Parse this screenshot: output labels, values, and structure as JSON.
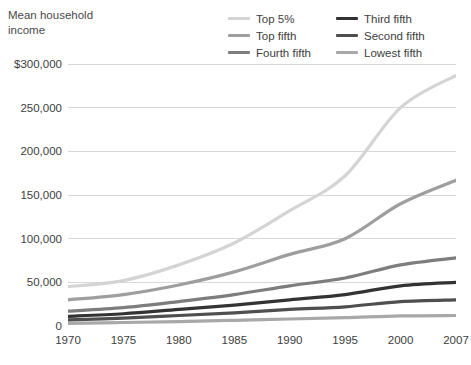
{
  "axis_title": "Mean household\nincome",
  "legend": {
    "entries": [
      {
        "label": "Top 5%",
        "color": "#d4d4d4",
        "column": 0
      },
      {
        "label": "Third fifth",
        "color": "#333333",
        "column": 1
      },
      {
        "label": "Top fifth",
        "color": "#9e9e9e",
        "column": 0
      },
      {
        "label": "Second fifth",
        "color": "#4f4f4f",
        "column": 1
      },
      {
        "label": "Fourth fifth",
        "color": "#7d7d7d",
        "column": 0
      },
      {
        "label": "Lowest fifth",
        "color": "#a8a8a8",
        "column": 1
      }
    ]
  },
  "chart_data": {
    "type": "line",
    "title": "",
    "xlabel": "",
    "ylabel": "Mean household income",
    "x": [
      1970,
      1975,
      1980,
      1985,
      1990,
      1995,
      2000,
      2007
    ],
    "xtick_labels": [
      "1970",
      "1975",
      "1980",
      "1985",
      "1990",
      "1995",
      "2000",
      "2007"
    ],
    "ytick_labels": [
      "$300,000",
      "250,000",
      "200,000",
      "150,000",
      "100,000",
      "50,000",
      "0"
    ],
    "ytick_values": [
      300000,
      250000,
      200000,
      150000,
      100000,
      50000,
      0
    ],
    "ylim": [
      0,
      300000
    ],
    "xlim": [
      1970,
      2007
    ],
    "grid": true,
    "legend_position": "top-right",
    "series": [
      {
        "name": "Top 5%",
        "color": "#d4d4d4",
        "width": 3.2,
        "values": [
          45000,
          52000,
          70000,
          95000,
          132000,
          172000,
          250000,
          287000
        ]
      },
      {
        "name": "Top fifth",
        "color": "#9e9e9e",
        "width": 3.2,
        "values": [
          30000,
          36000,
          47000,
          62000,
          82000,
          100000,
          140000,
          167000
        ]
      },
      {
        "name": "Fourth fifth",
        "color": "#7d7d7d",
        "width": 3.2,
        "values": [
          17000,
          21000,
          28000,
          36000,
          46000,
          55000,
          70000,
          78000
        ]
      },
      {
        "name": "Third fifth",
        "color": "#333333",
        "width": 3.2,
        "values": [
          11000,
          14000,
          19000,
          24000,
          30000,
          36000,
          46000,
          50000
        ]
      },
      {
        "name": "Second fifth",
        "color": "#4f4f4f",
        "width": 3.2,
        "values": [
          7000,
          9000,
          12000,
          15000,
          19000,
          22000,
          28000,
          30000
        ]
      },
      {
        "name": "Lowest fifth",
        "color": "#a8a8a8",
        "width": 3.2,
        "values": [
          3000,
          4000,
          5000,
          6500,
          8000,
          9500,
          11500,
          12000
        ]
      }
    ]
  }
}
